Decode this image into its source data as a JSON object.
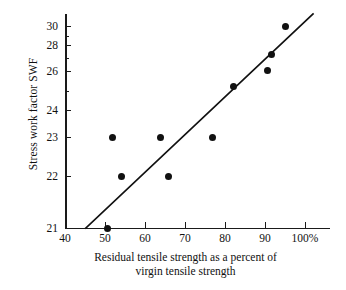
{
  "chart_data": {
    "type": "scatter",
    "title": "",
    "xlabel": "Residual tensile strength as a percent of virgin tensile strength",
    "xlabel_line1": "Residual tensile strength as a percent of",
    "xlabel_line2": "virgin tensile strength",
    "ylabel": "Stress work factor SWF",
    "xlim": [
      40,
      101
    ],
    "ylim": [
      21,
      30
    ],
    "grid": false,
    "legend": null,
    "x_ticks": [
      {
        "value": 40,
        "label": "40"
      },
      {
        "value": 50,
        "label": "50"
      },
      {
        "value": 60,
        "label": "60"
      },
      {
        "value": 70,
        "label": "70"
      },
      {
        "value": 80,
        "label": "80"
      },
      {
        "value": 90,
        "label": "90"
      },
      {
        "value": 100,
        "label": "100%"
      }
    ],
    "y_ticks": [
      {
        "value": 30,
        "label": "30",
        "major": true
      },
      {
        "value": 29,
        "label": "",
        "major": false
      },
      {
        "value": 28,
        "label": "28",
        "major": true
      },
      {
        "value": 27,
        "label": "",
        "major": false
      },
      {
        "value": 26,
        "label": "26",
        "major": true
      },
      {
        "value": 25,
        "label": "",
        "major": false
      },
      {
        "value": 24,
        "label": "24",
        "major": true
      },
      {
        "value": 23,
        "label": "23",
        "major": true
      },
      {
        "value": 22,
        "label": "22",
        "major": true
      },
      {
        "value": 21,
        "label": "21",
        "major": true
      }
    ],
    "points": [
      {
        "x": 50.5,
        "y": 21.0
      },
      {
        "x": 51.8,
        "y": 23.0
      },
      {
        "x": 54.2,
        "y": 22.0
      },
      {
        "x": 63.8,
        "y": 23.0
      },
      {
        "x": 65.8,
        "y": 22.0
      },
      {
        "x": 76.8,
        "y": 23.0
      },
      {
        "x": 82.0,
        "y": 25.2
      },
      {
        "x": 90.5,
        "y": 26.05
      },
      {
        "x": 91.5,
        "y": 27.3
      },
      {
        "x": 95.0,
        "y": 30.0
      }
    ],
    "trend_line": {
      "type": "line",
      "x_start": 45.2,
      "y_start": 21.0,
      "x_end": 102.0,
      "y_end": 30.45,
      "color": "#111111"
    },
    "colors": {
      "point": "#111111",
      "axis": "#1a1a1a",
      "background": "#ffffff"
    }
  }
}
